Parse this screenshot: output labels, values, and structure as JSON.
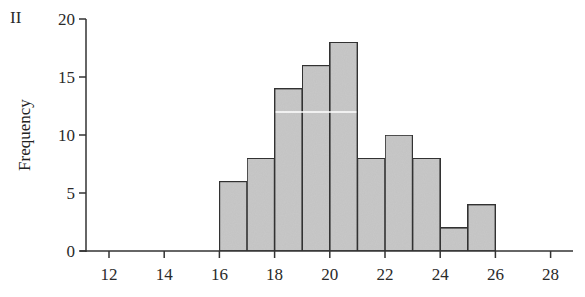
{
  "panel_label": "II",
  "chart_data": {
    "type": "bar",
    "subtype": "histogram",
    "title": "",
    "xlabel": "",
    "ylabel": "Frequency",
    "bin_edges": [
      16,
      17,
      18,
      19,
      20,
      21,
      22,
      23,
      24,
      25,
      26
    ],
    "categories": [
      "16-17",
      "17-18",
      "18-19",
      "19-20",
      "20-21",
      "21-22",
      "22-23",
      "23-24",
      "24-25",
      "25-26"
    ],
    "values": [
      6,
      8,
      14,
      16,
      18,
      8,
      10,
      8,
      2,
      4
    ],
    "xlim": [
      11,
      29
    ],
    "ylim": [
      0,
      20
    ],
    "xticks": [
      12,
      14,
      16,
      18,
      20,
      22,
      24,
      26,
      28
    ],
    "yticks": [
      0,
      5,
      10,
      15,
      20
    ],
    "grid": false,
    "legend": null,
    "bar_fill": "#c8c8c8",
    "bar_edge": "#333333"
  }
}
